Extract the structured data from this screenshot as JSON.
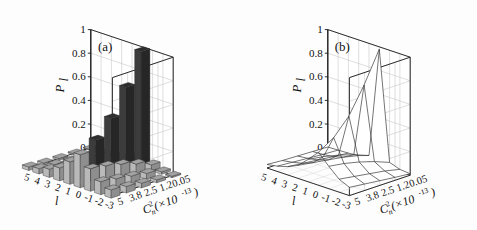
{
  "figure": {
    "background": "#fdfdfd",
    "panels": [
      {
        "tag": "(a)",
        "name": "bar3d-panel",
        "type": "bar3d"
      },
      {
        "tag": "(b)",
        "name": "mesh3d-panel",
        "type": "mesh"
      }
    ]
  },
  "axes": {
    "z_label": "P",
    "z_sub": "l",
    "z_ticks": [
      "0",
      "0.2",
      "0.4",
      "0.6",
      "0.8",
      "1"
    ],
    "z_values": [
      0,
      0.2,
      0.4,
      0.6,
      0.8,
      1.0
    ],
    "z_lim": [
      0,
      1
    ],
    "x_label": "l",
    "x_ticks": [
      "5",
      "4",
      "3",
      "2",
      "1",
      "0",
      "-1",
      "-2",
      "-3"
    ],
    "x_values": [
      5,
      4,
      3,
      2,
      1,
      0,
      -1,
      -2,
      -3
    ],
    "y_label_base": "C",
    "y_label_sup": "2",
    "y_label_sub": "n",
    "y_label_scale": "(×10",
    "y_label_exp": "-13",
    "y_label_close": ")",
    "y_ticks": [
      "5",
      "3.8",
      "2.5",
      "1.2",
      "0.05"
    ],
    "y_values": [
      5,
      3.8,
      2.5,
      1.2,
      0.05
    ],
    "grid": true,
    "legend": "none"
  },
  "chart_data": {
    "type": "bar",
    "title": "",
    "xlabel": "l",
    "ylabel": "Cn2 (x10^-13)",
    "zlabel": "P_l",
    "zlim": [
      0,
      1
    ],
    "x_categories": [
      5,
      4,
      3,
      2,
      1,
      0,
      -1,
      -2,
      -3
    ],
    "y_categories": [
      5,
      3.8,
      2.5,
      1.2,
      0.05
    ],
    "panel_a": {
      "type": "bar3d",
      "description": "Probability P_l of orbital angular momentum mode l versus refractive index structure constant Cn2. Peak at l=0 for weakest turbulence.",
      "rows": [
        {
          "y": 0.05,
          "values": [
            0.005,
            0.008,
            0.012,
            0.02,
            0.05,
            0.98,
            0.05,
            0.02,
            0.012
          ]
        },
        {
          "y": 1.2,
          "values": [
            0.01,
            0.015,
            0.025,
            0.05,
            0.1,
            0.72,
            0.1,
            0.05,
            0.025
          ]
        },
        {
          "y": 2.5,
          "values": [
            0.015,
            0.025,
            0.04,
            0.07,
            0.14,
            0.5,
            0.14,
            0.07,
            0.04
          ]
        },
        {
          "y": 3.8,
          "values": [
            0.02,
            0.035,
            0.055,
            0.09,
            0.17,
            0.36,
            0.17,
            0.09,
            0.055
          ]
        },
        {
          "y": 5.0,
          "values": [
            0.03,
            0.045,
            0.07,
            0.11,
            0.19,
            0.28,
            0.19,
            0.11,
            0.07
          ]
        }
      ]
    },
    "panel_b": {
      "type": "mesh",
      "description": "Mesh surface of the same P_l distribution; sharp ridge at l=0 rising to ~1 at Cn2 = 0.05.",
      "rows": [
        {
          "y": 0.05,
          "values": [
            0.005,
            0.008,
            0.012,
            0.02,
            0.05,
            0.98,
            0.05,
            0.02,
            0.012
          ]
        },
        {
          "y": 1.2,
          "values": [
            0.01,
            0.015,
            0.025,
            0.05,
            0.1,
            0.72,
            0.1,
            0.05,
            0.025
          ]
        },
        {
          "y": 2.5,
          "values": [
            0.015,
            0.025,
            0.04,
            0.07,
            0.14,
            0.5,
            0.14,
            0.07,
            0.04
          ]
        },
        {
          "y": 3.8,
          "values": [
            0.02,
            0.035,
            0.055,
            0.09,
            0.17,
            0.36,
            0.17,
            0.09,
            0.055
          ]
        },
        {
          "y": 5.0,
          "values": [
            0.03,
            0.045,
            0.07,
            0.11,
            0.19,
            0.28,
            0.19,
            0.11,
            0.07
          ]
        }
      ]
    }
  },
  "colors": {
    "axis": "#1a1a1a",
    "grid": "#c8c8c8",
    "bar_front": "#b4b4b4",
    "bar_top": "#8c8c8c",
    "bar_side": "#6e6e6e",
    "bar_dark": "#3a3a3a",
    "floor_dark": "#4a4a4a",
    "mesh": "#3a3a3a",
    "background": "#fdfdfd"
  }
}
